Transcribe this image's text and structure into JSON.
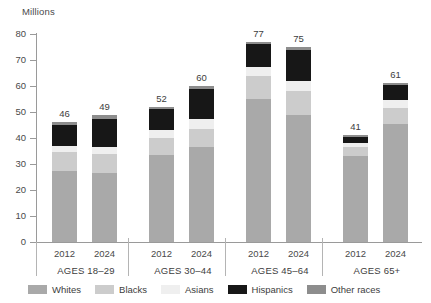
{
  "chart_data": {
    "type": "bar",
    "subtype": "stacked-bar",
    "title": "",
    "subtitle": "",
    "xlabel": "",
    "ylabel": "Millions",
    "ylim": [
      0,
      80
    ],
    "ytick_step": 10,
    "yticks": [
      "80",
      "70",
      "60",
      "50",
      "40",
      "30",
      "20",
      "10",
      "0"
    ],
    "grid": false,
    "legend_position": "bottom",
    "categories": [
      "2012",
      "2024",
      "2012",
      "2024",
      "2012",
      "2024",
      "2012",
      "2024"
    ],
    "groups": [
      {
        "label": "AGES 18–29",
        "bars": [
          {
            "year": "2012",
            "total": "46",
            "total_value": 46,
            "segments": [
              {
                "name": "Whites",
                "value": 27.5
              },
              {
                "name": "Blacks",
                "value": 7.0
              },
              {
                "name": "Asians",
                "value": 2.5
              },
              {
                "name": "Hispanics",
                "value": 8.0
              },
              {
                "name": "Other races",
                "value": 1.0
              }
            ]
          },
          {
            "year": "2024",
            "total": "49",
            "total_value": 49,
            "segments": [
              {
                "name": "Whites",
                "value": 26.5
              },
              {
                "name": "Blacks",
                "value": 7.5
              },
              {
                "name": "Asians",
                "value": 2.5
              },
              {
                "name": "Hispanics",
                "value": 11.0
              },
              {
                "name": "Other races",
                "value": 1.5
              }
            ]
          }
        ]
      },
      {
        "label": "AGES 30–44",
        "bars": [
          {
            "year": "2012",
            "total": "52",
            "total_value": 52,
            "segments": [
              {
                "name": "Whites",
                "value": 33.5
              },
              {
                "name": "Blacks",
                "value": 6.5
              },
              {
                "name": "Asians",
                "value": 3.0
              },
              {
                "name": "Hispanics",
                "value": 8.0
              },
              {
                "name": "Other races",
                "value": 1.0
              }
            ]
          },
          {
            "year": "2024",
            "total": "60",
            "total_value": 60,
            "segments": [
              {
                "name": "Whites",
                "value": 36.5
              },
              {
                "name": "Blacks",
                "value": 7.0
              },
              {
                "name": "Asians",
                "value": 4.0
              },
              {
                "name": "Hispanics",
                "value": 11.5
              },
              {
                "name": "Other races",
                "value": 1.0
              }
            ]
          }
        ]
      },
      {
        "label": "AGES 45–64",
        "bars": [
          {
            "year": "2012",
            "total": "77",
            "total_value": 77,
            "segments": [
              {
                "name": "Whites",
                "value": 55.0
              },
              {
                "name": "Blacks",
                "value": 9.0
              },
              {
                "name": "Asians",
                "value": 3.5
              },
              {
                "name": "Hispanics",
                "value": 8.5
              },
              {
                "name": "Other races",
                "value": 1.0
              }
            ]
          },
          {
            "year": "2024",
            "total": "75",
            "total_value": 75,
            "segments": [
              {
                "name": "Whites",
                "value": 49.0
              },
              {
                "name": "Blacks",
                "value": 9.0
              },
              {
                "name": "Asians",
                "value": 4.0
              },
              {
                "name": "Hispanics",
                "value": 12.0
              },
              {
                "name": "Other races",
                "value": 1.0
              }
            ]
          }
        ]
      },
      {
        "label": "AGES 65+",
        "bars": [
          {
            "year": "2012",
            "total": "41",
            "total_value": 41,
            "segments": [
              {
                "name": "Whites",
                "value": 33.0
              },
              {
                "name": "Blacks",
                "value": 3.5
              },
              {
                "name": "Asians",
                "value": 1.5
              },
              {
                "name": "Hispanics",
                "value": 2.5
              },
              {
                "name": "Other races",
                "value": 0.5
              }
            ]
          },
          {
            "year": "2024",
            "total": "61",
            "total_value": 61,
            "segments": [
              {
                "name": "Whites",
                "value": 45.5
              },
              {
                "name": "Blacks",
                "value": 6.0
              },
              {
                "name": "Asians",
                "value": 3.0
              },
              {
                "name": "Hispanics",
                "value": 6.0
              },
              {
                "name": "Other races",
                "value": 0.5
              }
            ]
          }
        ]
      }
    ],
    "series": [
      {
        "name": "Whites",
        "color": "#a9a9a9",
        "values": [
          27.5,
          26.5,
          33.5,
          36.5,
          55.0,
          49.0,
          33.0,
          45.5
        ]
      },
      {
        "name": "Blacks",
        "color": "#cccccc",
        "values": [
          7.0,
          7.5,
          6.5,
          7.0,
          9.0,
          9.0,
          3.5,
          6.0
        ]
      },
      {
        "name": "Asians",
        "color": "#efefef",
        "values": [
          2.5,
          2.5,
          3.0,
          4.0,
          3.5,
          4.0,
          1.5,
          3.0
        ]
      },
      {
        "name": "Hispanics",
        "color": "#171717",
        "values": [
          8.0,
          11.0,
          8.0,
          11.5,
          8.5,
          12.0,
          2.5,
          6.0
        ]
      },
      {
        "name": "Other races",
        "color": "#8d8d8d",
        "values": [
          1.0,
          1.5,
          1.0,
          1.0,
          1.0,
          1.0,
          0.5,
          0.5
        ]
      }
    ]
  },
  "legend": {
    "items": [
      {
        "label": "Whites",
        "color": "#a9a9a9"
      },
      {
        "label": "Blacks",
        "color": "#cccccc"
      },
      {
        "label": "Asians",
        "color": "#efefef"
      },
      {
        "label": "Hispanics",
        "color": "#171717"
      },
      {
        "label": "Other races",
        "color": "#8d8d8d"
      }
    ]
  },
  "axis": {
    "y_title": "Millions",
    "y_tick_labels": [
      "80",
      "70",
      "60",
      "50",
      "40",
      "30",
      "20",
      "10",
      "0"
    ]
  },
  "group_labels": [
    "AGES 18–29",
    "AGES 30–44",
    "AGES 45–64",
    "AGES 65+"
  ],
  "year_labels": [
    "2012",
    "2024",
    "2012",
    "2024",
    "2012",
    "2024",
    "2012",
    "2024"
  ],
  "bar_totals": [
    "46",
    "49",
    "52",
    "60",
    "77",
    "75",
    "41",
    "61"
  ],
  "colors": {
    "axis": "#9a9a9a",
    "separator": "#b4b4b4",
    "text": "#3d3d3d",
    "background": "#ffffff"
  }
}
